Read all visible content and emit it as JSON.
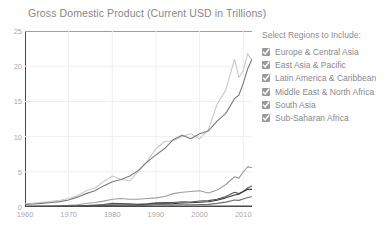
{
  "chart_data": {
    "type": "line",
    "title": "Gross Domestic Product (Current USD in Trillions)",
    "xlabel": "",
    "ylabel": "",
    "xlim": [
      1960,
      2012
    ],
    "ylim": [
      0,
      25
    ],
    "ytick_labels": [
      "0",
      "5",
      "10",
      "15",
      "20",
      "25"
    ],
    "ytick_values": [
      0,
      5,
      10,
      15,
      20,
      25
    ],
    "xtick_labels": [
      "1960",
      "1970",
      "1980",
      "1990",
      "2000",
      "2010"
    ],
    "xtick_values": [
      1960,
      1970,
      1980,
      1990,
      2000,
      2010
    ],
    "grid": true,
    "legend_position": "right",
    "x": [
      1960,
      1962,
      1964,
      1966,
      1968,
      1970,
      1972,
      1974,
      1976,
      1978,
      1980,
      1982,
      1984,
      1986,
      1988,
      1990,
      1992,
      1994,
      1996,
      1998,
      2000,
      2002,
      2004,
      2006,
      2008,
      2009,
      2010,
      2011,
      2012
    ],
    "series": [
      {
        "name": "Europe & Central Asia",
        "color": "#c9c9c9",
        "values": [
          0.45,
          0.55,
          0.68,
          0.82,
          0.95,
          1.2,
          1.6,
          2.3,
          2.7,
          3.6,
          4.4,
          3.9,
          3.7,
          5.1,
          6.5,
          8.3,
          9.3,
          9.4,
          10.0,
          10.4,
          9.7,
          11.0,
          14.6,
          16.6,
          21.0,
          18.4,
          19.4,
          21.8,
          20.8
        ]
      },
      {
        "name": "East Asia & Pacific",
        "color": "#7a7a7a",
        "values": [
          0.35,
          0.42,
          0.52,
          0.64,
          0.76,
          1.0,
          1.4,
          1.9,
          2.3,
          3.0,
          3.6,
          3.9,
          4.4,
          5.2,
          6.4,
          7.4,
          8.3,
          9.6,
          10.2,
          9.7,
          10.4,
          10.8,
          12.2,
          13.3,
          15.4,
          15.9,
          17.6,
          19.6,
          21.0
        ]
      },
      {
        "name": "Latin America & Caribbean",
        "color": "#9c9c9c",
        "values": [
          0.08,
          0.1,
          0.12,
          0.15,
          0.18,
          0.23,
          0.32,
          0.49,
          0.63,
          0.83,
          1.1,
          1.2,
          1.1,
          1.1,
          1.2,
          1.3,
          1.5,
          1.9,
          2.1,
          2.2,
          2.3,
          2.0,
          2.4,
          3.2,
          4.3,
          4.1,
          5.0,
          5.7,
          5.6
        ]
      },
      {
        "name": "Middle East & North Africa",
        "color": "#555555",
        "values": [
          0.02,
          0.03,
          0.04,
          0.05,
          0.06,
          0.08,
          0.11,
          0.22,
          0.28,
          0.35,
          0.52,
          0.5,
          0.47,
          0.4,
          0.44,
          0.58,
          0.62,
          0.64,
          0.75,
          0.7,
          0.86,
          0.9,
          1.1,
          1.5,
          2.1,
          1.9,
          2.2,
          2.7,
          3.0
        ]
      },
      {
        "name": "South Asia",
        "color": "#3a3a3a",
        "values": [
          0.05,
          0.06,
          0.07,
          0.08,
          0.09,
          0.11,
          0.13,
          0.16,
          0.18,
          0.23,
          0.27,
          0.29,
          0.31,
          0.34,
          0.4,
          0.45,
          0.44,
          0.48,
          0.57,
          0.6,
          0.68,
          0.74,
          0.96,
          1.3,
          1.7,
          1.8,
          2.2,
          2.5,
          2.5
        ]
      },
      {
        "name": "Sub-Saharan Africa",
        "color": "#6e6e6e",
        "values": [
          0.03,
          0.035,
          0.04,
          0.05,
          0.055,
          0.07,
          0.09,
          0.13,
          0.16,
          0.2,
          0.28,
          0.29,
          0.26,
          0.25,
          0.27,
          0.31,
          0.31,
          0.29,
          0.33,
          0.33,
          0.36,
          0.37,
          0.51,
          0.69,
          0.99,
          0.94,
          1.15,
          1.35,
          1.45
        ]
      }
    ]
  },
  "legend": {
    "title": "Select Regions to Include:",
    "items": [
      {
        "label": "Europe & Central Asia",
        "checked": true
      },
      {
        "label": "East Asia & Pacific",
        "checked": true
      },
      {
        "label": "Latin America & Caribbean",
        "checked": true
      },
      {
        "label": "Middle East & North Africa",
        "checked": true
      },
      {
        "label": "South Asia",
        "checked": true
      },
      {
        "label": "Sub-Saharan Africa",
        "checked": true
      }
    ]
  }
}
